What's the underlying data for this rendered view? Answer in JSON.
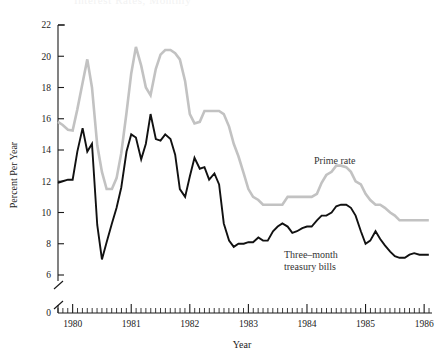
{
  "figure": {
    "cut_title": "Interest Rates, Monthly"
  },
  "axes": {
    "y_label": "Percent Per Year",
    "x_label": "Year",
    "y_ticks": [
      "0",
      "6",
      "8",
      "10",
      "12",
      "14",
      "16",
      "18",
      "20",
      "22"
    ],
    "x_ticks": [
      "1980",
      "1981",
      "1982",
      "1983",
      "1984",
      "1985",
      "1986"
    ]
  },
  "annotations": {
    "prime": "Prime rate",
    "tbill_line1": "Three–month",
    "tbill_line2": "treasury bills"
  },
  "colors": {
    "prime": "#c2c2c2",
    "tbill": "#111111",
    "axis": "#1a1a1a",
    "background": "#ffffff"
  },
  "chart_data": {
    "type": "line",
    "title": "Interest Rates, Monthly",
    "xlabel": "Year",
    "ylabel": "Percent Per Year",
    "xlim": [
      1979.75,
      1986.1
    ],
    "ylim": [
      5.6,
      22
    ],
    "y_axis_break": true,
    "y_break_between": [
      0,
      6
    ],
    "grid": false,
    "legend": "inline-annotations",
    "x_major_ticks": [
      1980,
      1981,
      1982,
      1983,
      1984,
      1985,
      1986
    ],
    "x_minor_tick_interval": 0.0833,
    "y_ticks": [
      0,
      6,
      8,
      10,
      12,
      14,
      16,
      18,
      20,
      22
    ],
    "series": [
      {
        "name": "Prime rate",
        "color": "#c2c2c2",
        "x": [
          1979.75,
          1979.83,
          1979.92,
          1980.0,
          1980.08,
          1980.17,
          1980.25,
          1980.33,
          1980.42,
          1980.5,
          1980.58,
          1980.67,
          1980.75,
          1980.83,
          1980.92,
          1981.0,
          1981.08,
          1981.17,
          1981.25,
          1981.33,
          1981.42,
          1981.5,
          1981.58,
          1981.67,
          1981.75,
          1981.83,
          1981.92,
          1982.0,
          1982.08,
          1982.17,
          1982.25,
          1982.33,
          1982.42,
          1982.5,
          1982.58,
          1982.67,
          1982.75,
          1982.83,
          1982.92,
          1983.0,
          1983.08,
          1983.17,
          1983.25,
          1983.33,
          1983.42,
          1983.5,
          1983.58,
          1983.67,
          1983.75,
          1983.83,
          1983.92,
          1984.0,
          1984.08,
          1984.17,
          1984.25,
          1984.33,
          1984.42,
          1984.5,
          1984.58,
          1984.67,
          1984.75,
          1984.83,
          1984.92,
          1985.0,
          1985.08,
          1985.17,
          1985.25,
          1985.33,
          1985.42,
          1985.5,
          1985.58,
          1985.67,
          1985.75,
          1985.83,
          1985.92,
          1986.0,
          1986.08
        ],
        "values": [
          15.8,
          15.6,
          15.3,
          15.25,
          16.6,
          18.3,
          19.8,
          18.0,
          14.3,
          12.6,
          11.5,
          11.5,
          12.2,
          13.8,
          16.4,
          18.9,
          20.6,
          19.4,
          18.0,
          17.5,
          19.2,
          20.1,
          20.4,
          20.4,
          20.2,
          19.8,
          18.4,
          16.3,
          15.7,
          15.8,
          16.5,
          16.5,
          16.5,
          16.5,
          16.3,
          15.5,
          14.4,
          13.6,
          12.5,
          11.5,
          11.0,
          10.8,
          10.5,
          10.5,
          10.5,
          10.5,
          10.5,
          11.0,
          11.0,
          11.0,
          11.0,
          11.0,
          11.0,
          11.2,
          11.9,
          12.4,
          12.6,
          13.0,
          13.0,
          12.9,
          12.6,
          12.0,
          11.8,
          11.2,
          10.8,
          10.5,
          10.5,
          10.3,
          10.0,
          9.8,
          9.5,
          9.5,
          9.5,
          9.5,
          9.5,
          9.5,
          9.5
        ]
      },
      {
        "name": "Three-month treasury bills",
        "color": "#111111",
        "x": [
          1979.75,
          1979.83,
          1979.92,
          1980.0,
          1980.08,
          1980.17,
          1980.25,
          1980.33,
          1980.42,
          1980.5,
          1980.58,
          1980.67,
          1980.75,
          1980.83,
          1980.92,
          1981.0,
          1981.08,
          1981.17,
          1981.25,
          1981.33,
          1981.42,
          1981.5,
          1981.58,
          1981.67,
          1981.75,
          1981.83,
          1981.92,
          1982.0,
          1982.08,
          1982.17,
          1982.25,
          1982.33,
          1982.42,
          1982.5,
          1982.58,
          1982.67,
          1982.75,
          1982.83,
          1982.92,
          1983.0,
          1983.08,
          1983.17,
          1983.25,
          1983.33,
          1983.42,
          1983.5,
          1983.58,
          1983.67,
          1983.75,
          1983.83,
          1983.92,
          1984.0,
          1984.08,
          1984.17,
          1984.25,
          1984.33,
          1984.42,
          1984.5,
          1984.58,
          1984.67,
          1984.75,
          1984.83,
          1984.92,
          1985.0,
          1985.08,
          1985.17,
          1985.25,
          1985.33,
          1985.42,
          1985.5,
          1985.58,
          1985.67,
          1985.75,
          1985.83,
          1985.92,
          1986.0,
          1986.08
        ],
        "values": [
          11.9,
          12.0,
          12.1,
          12.1,
          13.9,
          15.4,
          13.9,
          14.4,
          9.2,
          7.0,
          8.1,
          9.3,
          10.3,
          11.6,
          13.9,
          15.0,
          14.8,
          13.4,
          14.4,
          16.3,
          14.7,
          14.6,
          15.0,
          14.7,
          13.7,
          11.5,
          11.0,
          12.3,
          13.5,
          12.8,
          12.9,
          12.1,
          12.5,
          11.8,
          9.3,
          8.2,
          7.8,
          8.0,
          8.0,
          8.1,
          8.1,
          8.4,
          8.2,
          8.2,
          8.8,
          9.1,
          9.3,
          9.1,
          8.7,
          8.8,
          9.0,
          9.1,
          9.1,
          9.5,
          9.8,
          9.8,
          10.0,
          10.4,
          10.5,
          10.5,
          10.3,
          9.8,
          8.8,
          8.0,
          8.2,
          8.8,
          8.3,
          7.9,
          7.5,
          7.2,
          7.1,
          7.1,
          7.3,
          7.4,
          7.3,
          7.3,
          7.3
        ]
      }
    ]
  }
}
